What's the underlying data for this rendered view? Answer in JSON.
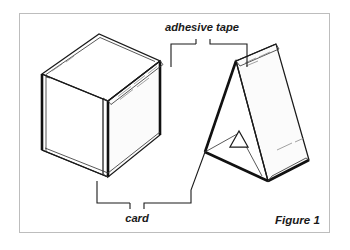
{
  "figure": {
    "caption": "Figure 1",
    "background_color": "#ffffff",
    "line_color": "#1a1a1a",
    "frame_color": "#bdbdbd",
    "tape_hatch_color": "#8a8a8a"
  },
  "frame": {
    "name": "figure-border",
    "x": 19,
    "y": 13,
    "width": 311,
    "height": 220
  },
  "labels": {
    "adhesive_tape": "adhesive tape",
    "card": "card",
    "figure_caption": "Figure 1"
  },
  "callouts": [
    {
      "id": "adhesive-tape-callout",
      "label": "adhesive tape",
      "label_x": 202,
      "label_y": 31,
      "points_to": [
        "cube-top-tape-strip",
        "prism-ridge-tape-strip"
      ],
      "bracket_y": 44,
      "left_target_x": 171,
      "right_target_x": 247,
      "stem_left_x": 196,
      "stem_right_x": 210
    },
    {
      "id": "card-callout",
      "label": "card",
      "label_x": 135,
      "label_y": 221,
      "points_to": [
        "cube-body",
        "prism-body"
      ],
      "bracket_y": 203,
      "left_target_x": 97,
      "right_target_x": 213,
      "stem_left_x": 130,
      "stem_right_x": 144
    }
  ],
  "objects": [
    {
      "id": "cube-body",
      "name": "open-card-cube",
      "description": "Open-topped cube folded from card, drawn in oblique projection, left of figure",
      "has_tape_strip": true,
      "tape_location": "top-right-edge"
    },
    {
      "id": "prism-body",
      "name": "triangular-card-prism",
      "description": "Triangular prism / tent folded from card with small triangular aperture, right of figure",
      "has_tape_strip": true,
      "tape_location": "apex-ridge"
    }
  ],
  "geometry": {
    "cube": {
      "top_face": "42,74 99,34 160,61 108,101",
      "left_face": "42,74 42,150 108,177 108,101",
      "front_inner": "42,150 108,177 108,101",
      "right_face": "108,101 160,61 160,135 108,177",
      "thick_left_edge": "42,74 42,150",
      "thick_front_edge": "108,101 108,177",
      "base_edge": "42,150 108,177 160,135"
    },
    "prism": {
      "apex": "236,61",
      "front_left_base": "205,152",
      "front_right_base": "268,181",
      "back_apex": "276,44",
      "back_right_base": "309,160",
      "aperture": "239,133 248,147 231,147"
    }
  }
}
